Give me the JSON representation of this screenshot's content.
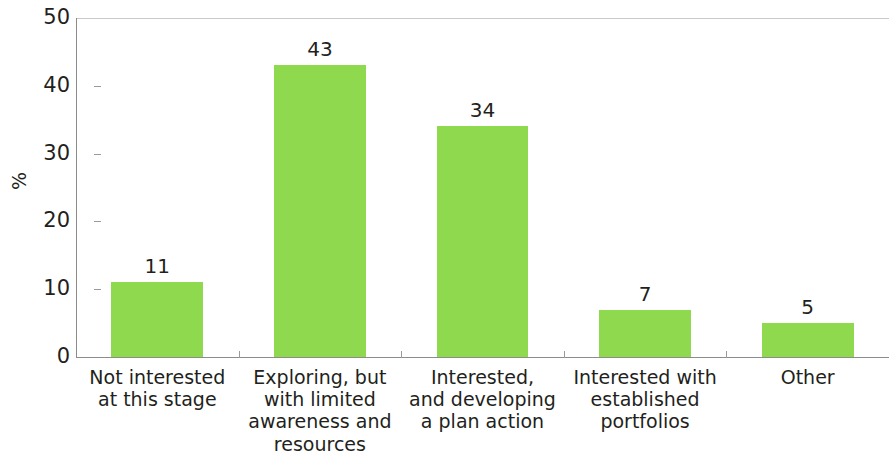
{
  "chart_data": {
    "type": "bar",
    "title": "",
    "subtitle": "",
    "xlabel": "",
    "ylabel": "%",
    "categories": [
      "Not interested\nat this stage",
      "Exploring, but\nwith limited\nawareness and\nresources",
      "Interested,\nand developing\na plan action",
      "Interested with\nestablished\nportfolios",
      "Other"
    ],
    "values": [
      11,
      43,
      34,
      7,
      5
    ],
    "value_labels": [
      "11",
      "43",
      "34",
      "7",
      "5"
    ],
    "ylim": [
      0,
      50
    ],
    "ytick_labels": [
      "0",
      "10",
      "20",
      "30",
      "40",
      "50"
    ],
    "ytick_values": [
      0,
      10,
      20,
      30,
      40,
      50
    ],
    "grid": false,
    "legend": null,
    "bar_color": "#8fd94f",
    "axis_color": "#8c8c8c",
    "text_color": "#231f20"
  }
}
